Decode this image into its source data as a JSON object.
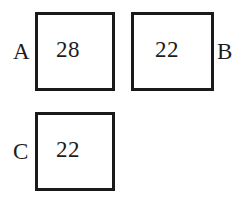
{
  "diagram": {
    "type": "labeled-squares",
    "background_color": "#ffffff",
    "stroke_color": "#1a1a1a",
    "text_color": "#1c1c1c",
    "squares": [
      {
        "label": "A",
        "value": "28",
        "label_side": "left",
        "row": 1,
        "column": 1
      },
      {
        "label": "B",
        "value": "22",
        "label_side": "right",
        "row": 1,
        "column": 2
      },
      {
        "label": "C",
        "value": "22",
        "label_side": "left",
        "row": 2,
        "column": 1
      }
    ]
  },
  "chart_data": {
    "type": "bar",
    "categories": [
      "A",
      "B",
      "C"
    ],
    "values": [
      28,
      22,
      22
    ],
    "title": "",
    "xlabel": "",
    "ylabel": "",
    "ylim": [
      0,
      28
    ]
  }
}
